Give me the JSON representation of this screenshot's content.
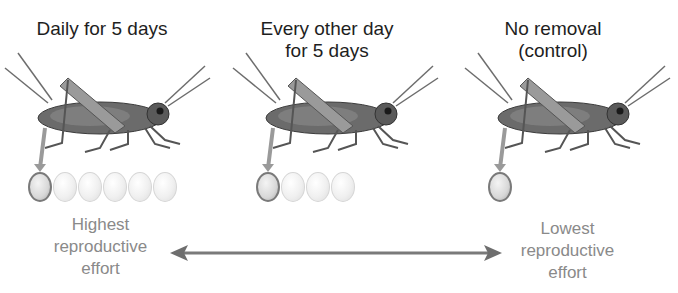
{
  "diagram": {
    "columns": [
      {
        "title": "Daily for 5 days",
        "eggs_total": 6,
        "eggs_laid": 1
      },
      {
        "title": "Every other day for 5 days",
        "title_line1": "Every other day",
        "title_line2": "for 5 days",
        "eggs_total": 4,
        "eggs_laid": 1
      },
      {
        "title": "No removal (control)",
        "title_line1": "No removal",
        "title_line2": "(control)",
        "eggs_total": 1,
        "eggs_laid": 1
      }
    ],
    "scale": {
      "left_label_line1": "Highest",
      "left_label_line2": "reproductive",
      "left_label_line3": "effort",
      "right_label_line1": "Lowest",
      "right_label_line2": "reproductive",
      "right_label_line3": "effort",
      "arrow_color": "#7a7a7a",
      "label_color": "#8a8a8a"
    },
    "icons": {
      "organism": "grasshopper-illustration",
      "egg": "egg-icon",
      "scale_arrow": "double-headed-arrow"
    }
  }
}
